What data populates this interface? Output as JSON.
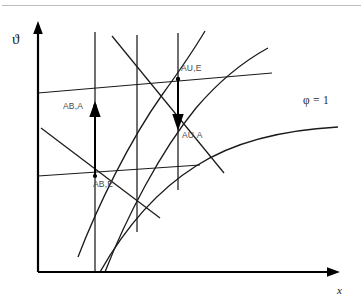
{
  "figure": {
    "kind": "mollier-hx-diagram",
    "background_color": "#ffffff",
    "line_color": "#1a1a1a",
    "label_color": "#4a4a4a"
  },
  "axes": {
    "y_label": "ϑ",
    "x_label": "x",
    "origin_px": [
      38,
      272
    ],
    "y_top_px": 24,
    "x_right_px": 338
  },
  "curve_labels": {
    "saturation": "φ = 1"
  },
  "state_points": [
    {
      "id": "AB-A",
      "label": "AB,A",
      "x_px": 95,
      "y_px": 107
    },
    {
      "id": "AB-E",
      "label": "AB,E",
      "x_px": 95,
      "y_px": 172
    },
    {
      "id": "AU-E",
      "label": "AU,E",
      "x_px": 178,
      "y_px": 79
    },
    {
      "id": "AU-A",
      "label": "AU,A",
      "x_px": 178,
      "y_px": 128
    }
  ],
  "process_arrows": [
    {
      "id": "AB-heating",
      "label": "AB,A",
      "direction": "up",
      "x_px": 95,
      "from_y_px": 175,
      "to_y_px": 104
    },
    {
      "id": "AU-cooling",
      "label": "AU,A",
      "direction": "down",
      "x_px": 178,
      "from_y_px": 79,
      "to_y_px": 128
    }
  ],
  "isolines": {
    "vertical_count": 3,
    "horizontal_count": 2,
    "enthalpy_count": 2,
    "humidity_count": 2
  }
}
